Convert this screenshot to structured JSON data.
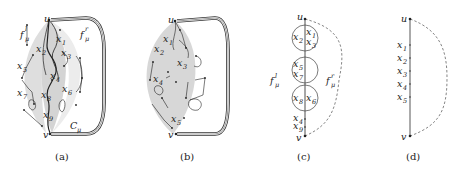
{
  "figure": {
    "panels": [
      {
        "id": "a",
        "caption": "(a)",
        "top_vertex": "u",
        "bottom_vertex": "v",
        "face_left": {
          "base": "f",
          "sub": "μ",
          "sup": "l"
        },
        "face_right": {
          "base": "f",
          "sub": "μ",
          "sup": "r"
        },
        "cycle": {
          "base": "C",
          "sub": "μ"
        },
        "vertices": [
          {
            "base": "x",
            "sub": "1"
          },
          {
            "base": "x",
            "sub": "2"
          },
          {
            "base": "x",
            "sub": "3"
          },
          {
            "base": "x",
            "sub": "4"
          },
          {
            "base": "x",
            "sub": "5"
          },
          {
            "base": "x",
            "sub": "6"
          },
          {
            "base": "x",
            "sub": "7"
          },
          {
            "base": "x",
            "sub": "8"
          },
          {
            "base": "x",
            "sub": "9"
          }
        ]
      },
      {
        "id": "b",
        "caption": "(b)",
        "top_vertex": "u",
        "bottom_vertex": "v",
        "vertices": [
          {
            "base": "x",
            "sub": "1"
          },
          {
            "base": "x",
            "sub": "2"
          },
          {
            "base": "x",
            "sub": "3"
          },
          {
            "base": "x",
            "sub": "4"
          },
          {
            "base": "x",
            "sub": "5"
          }
        ]
      },
      {
        "id": "c",
        "caption": "(c)",
        "top_vertex": "u",
        "bottom_vertex": "v",
        "face_left": {
          "base": "f",
          "sub": "μ",
          "sup": "l"
        },
        "face_right": {
          "base": "f",
          "sub": "μ",
          "sup": "r"
        },
        "circles": [
          {
            "left": {
              "base": "x",
              "sub": "2"
            },
            "right_top": {
              "base": "x",
              "sub": "1"
            },
            "right_bottom": {
              "base": "x",
              "sub": "3"
            }
          },
          {
            "left_top": {
              "base": "x",
              "sub": "5"
            },
            "left_bottom": {
              "base": "x",
              "sub": "7"
            }
          },
          {
            "left": {
              "base": "x",
              "sub": "8"
            },
            "right": {
              "base": "x",
              "sub": "6"
            }
          }
        ],
        "path_vertices": [
          {
            "base": "x",
            "sub": "4"
          },
          {
            "base": "x",
            "sub": "9"
          }
        ]
      },
      {
        "id": "d",
        "caption": "(d)",
        "top_vertex": "u",
        "bottom_vertex": "v",
        "path_vertices": [
          {
            "base": "x",
            "sub": "1"
          },
          {
            "base": "x",
            "sub": "2"
          },
          {
            "base": "x",
            "sub": "3"
          },
          {
            "base": "x",
            "sub": "4"
          },
          {
            "base": "x",
            "sub": "5"
          }
        ]
      }
    ],
    "colors": {
      "ink": "#222222",
      "shade": "#d9d9d9",
      "dashed": "#666666"
    }
  }
}
